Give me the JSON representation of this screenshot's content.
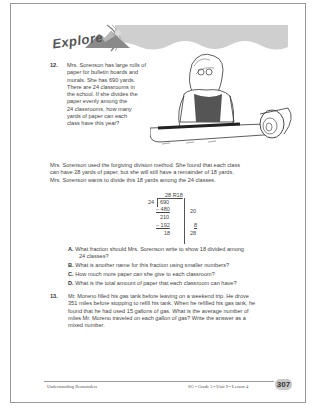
{
  "banner": {
    "title": "Explore"
  },
  "problem12": {
    "number": "12.",
    "lines": [
      "Mrs. Sorenson has large rolls of",
      "paper for bulletin boards and",
      "murals. She has 690 yards.",
      "There are 24 classrooms in",
      "the school. If she divides the",
      "paper evenly among the",
      "24 classrooms, how many",
      "yards of paper can each",
      "class have this year?"
    ],
    "explanation": [
      "Mrs. Sorenson used the forgiving division method. She found that each class",
      "can have 28 yards of paper, but she will still have a remainder of 18 yards.",
      "Mrs. Sorenson wants to divide this 18 yards among the 24 classes."
    ]
  },
  "division": {
    "quotient": "28 R18",
    "divisor": "24",
    "dividend": "690",
    "step1_sub": "– 480",
    "step1_partial": "20",
    "step1_rem": "210",
    "step2_sub": "– 192",
    "step2_partial": "8",
    "remainder": "18",
    "partial_sum": "28"
  },
  "subquestions": [
    {
      "letter": "A.",
      "lines": [
        "What fraction should Mrs. Sorenson write to show 18 divided among",
        "24 classes?"
      ]
    },
    {
      "letter": "B.",
      "lines": [
        "What is another name for this fraction using smaller numbers?"
      ]
    },
    {
      "letter": "C.",
      "lines": [
        "How much more paper can she give to each classroom?"
      ]
    },
    {
      "letter": "D.",
      "lines": [
        "What is the total amount of paper that each classroom can have?"
      ]
    }
  ],
  "problem13": {
    "number": "13.",
    "lines": [
      "Mr. Moreno filled his gas tank before leaving on a weekend trip. He drove",
      "351 miles before stopping to refill his tank. When he refilled his gas tank, he",
      "found that he had used 15 gallons of gas. What is the average number of",
      "miles Mr. Moreno traveled on each gallon of gas? Write the answer as a",
      "mixed number."
    ]
  },
  "footer": {
    "left": "Understanding Remainders",
    "right": "SG • Grade 5 • Unit 9 • Lesson 4",
    "page_number": "307"
  }
}
